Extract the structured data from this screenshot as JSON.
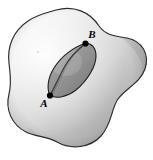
{
  "figure": {
    "kind": "geometry-diagram",
    "background_color": "#ffffff"
  },
  "surface": {
    "name": "outer-surface-blob",
    "outline_color": "#2b2b2b",
    "outline_width": 1.1,
    "fill_light": "#f2f2f2",
    "fill_mid": "#cfcfcf",
    "fill_dark": "#9a9a9a",
    "fill_edge": "#8c8c8c"
  },
  "region": {
    "name": "inner-lens-region",
    "outline_color": "#1e1e1e",
    "outline_width": 1.1,
    "fill_light": "#9d9d9d",
    "fill_dark": "#7b7b7b"
  },
  "curve": {
    "name": "geodesic-curve",
    "stroke_color": "#3a3a3a",
    "stroke_width": 1.2
  },
  "points": [
    {
      "id": "point-a",
      "label": "A",
      "x": 50,
      "y": 95.5,
      "radius": 3.1,
      "color": "#000000",
      "label_x": 44,
      "label_y": 107
    },
    {
      "id": "point-b",
      "label": "B",
      "x": 85.5,
      "y": 43.5,
      "radius": 3.1,
      "color": "#000000",
      "label_x": 90,
      "label_y": 38
    }
  ],
  "speck": {
    "name": "paper-speck",
    "x": 38,
    "y": 52,
    "color": "#b9b9b9"
  }
}
